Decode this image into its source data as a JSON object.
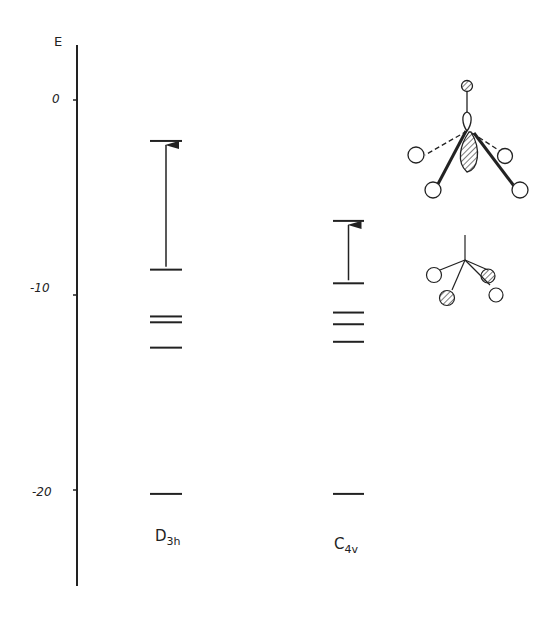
{
  "chart_data": {
    "type": "energy-level-diagram",
    "title": "",
    "ylabel": "E",
    "yticks": [
      {
        "value": 0,
        "label": "0"
      },
      {
        "value": -10,
        "label": "-10"
      },
      {
        "value": -20,
        "label": "-20"
      }
    ],
    "ylim": [
      -25,
      3
    ],
    "columns": [
      {
        "name": "D3h",
        "main": "D",
        "subscript": "3h",
        "levels": [
          -2.1,
          -8.7,
          -11.1,
          -11.4,
          -12.7,
          -20.2
        ],
        "transition": {
          "from": -8.7,
          "to": -2.1
        }
      },
      {
        "name": "C4v",
        "main": "C",
        "subscript": "4v",
        "levels": [
          -6.2,
          -9.4,
          -10.9,
          -11.5,
          -12.4,
          -20.2
        ],
        "transition": {
          "from": -9.4,
          "to": -6.2
        }
      }
    ],
    "annotations": [
      "orbital sketch: square-pyramidal (C4v) geometry with hatched lobe on central atom, apical hatched ligand",
      "orbital sketch: trigonal (D3h) fragment with two hatched and two open ligand lobes"
    ]
  },
  "axis": {
    "label": "E",
    "tick_0": "0",
    "tick_m10": "-10",
    "tick_m20": "-20"
  },
  "labels": {
    "d3h_main": "D",
    "d3h_sub": "3h",
    "c4v_main": "C",
    "c4v_sub": "4v"
  },
  "colors": {
    "ink": "#222222",
    "background": "#ffffff"
  }
}
